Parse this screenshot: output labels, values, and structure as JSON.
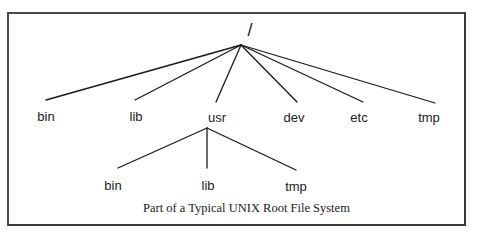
{
  "diagram": {
    "type": "tree",
    "caption": "Part of a Typical UNIX Root File System",
    "root": {
      "label": "/",
      "children": [
        {
          "label": "bin"
        },
        {
          "label": "lib"
        },
        {
          "label": "usr",
          "children": [
            {
              "label": "bin"
            },
            {
              "label": "lib"
            },
            {
              "label": "tmp"
            }
          ]
        },
        {
          "label": "dev"
        },
        {
          "label": "etc"
        },
        {
          "label": "tmp"
        }
      ]
    }
  },
  "labels": {
    "root": "/",
    "level1": [
      "bin",
      "lib",
      "usr",
      "dev",
      "etc",
      "tmp"
    ],
    "usr_children": [
      "bin",
      "lib",
      "tmp"
    ]
  },
  "colors": {
    "line": "#1a1a1a",
    "frame": "#4a4a4a",
    "background": "#ffffff"
  }
}
